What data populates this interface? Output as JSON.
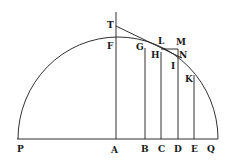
{
  "diagram": {
    "stroke_color": "#1a1a1a",
    "background": "#ffffff",
    "labels": {
      "T": "T",
      "F": "F",
      "G": "G",
      "L": "L",
      "M": "M",
      "H": "H",
      "N": "N",
      "I": "I",
      "K": "K",
      "P": "P",
      "A": "A",
      "B": "B",
      "C": "C",
      "D": "D",
      "E": "E",
      "Q": "Q"
    }
  }
}
